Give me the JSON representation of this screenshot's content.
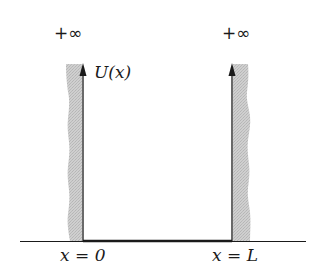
{
  "diagram": {
    "left_wall": {
      "top_label": "+∞",
      "axis_label": "U(x)",
      "position_label": "x = 0"
    },
    "right_wall": {
      "top_label": "+∞",
      "position_label": "x = L"
    },
    "colors": {
      "wall_fill": "#c8c8c8",
      "line": "#1a1a1a",
      "background": "#ffffff"
    }
  }
}
